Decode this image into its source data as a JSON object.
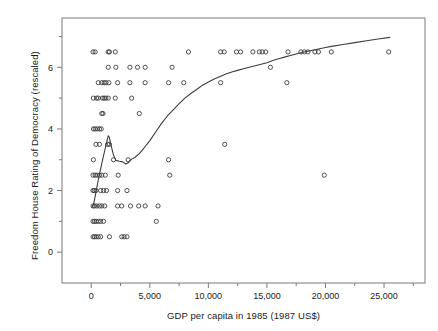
{
  "chart_data": {
    "type": "scatter",
    "title": "",
    "xlabel": "GDP per capita in 1985 (1987 US$)",
    "ylabel": "Freedom House Rating of Democracy (rescaled)",
    "xlim": [
      -2500,
      28500
    ],
    "ylim": [
      -1.0,
      7.6
    ],
    "grid": false,
    "legend": null,
    "xticks": [
      0,
      5000,
      10000,
      15000,
      20000,
      25000
    ],
    "xticklabels": [
      "0",
      "5,000",
      "10,000",
      "15,000",
      "20,000",
      "25,000"
    ],
    "xminorticks": [
      2500,
      7500,
      12500,
      17500,
      22500,
      27500
    ],
    "yticks": [
      0,
      2,
      4,
      6
    ],
    "yticklabels": [
      "0",
      "2",
      "4",
      "6"
    ],
    "yminorticks": [
      1,
      3,
      5,
      7
    ],
    "marker": "open-circle",
    "marker_color": "#3c3c3c",
    "line_color": "#3c3c3c",
    "frame_color": "#7a7a7a",
    "background": "#ffffff",
    "points": [
      [
        150,
        6.5
      ],
      [
        330,
        6.5
      ],
      [
        1450,
        6.5
      ],
      [
        1550,
        6.5
      ],
      [
        2050,
        6.5
      ],
      [
        8300,
        6.5
      ],
      [
        11050,
        6.5
      ],
      [
        11350,
        6.5
      ],
      [
        12400,
        6.5
      ],
      [
        12750,
        6.5
      ],
      [
        13800,
        6.5
      ],
      [
        14350,
        6.5
      ],
      [
        14600,
        6.5
      ],
      [
        14900,
        6.5
      ],
      [
        16800,
        6.5
      ],
      [
        17900,
        6.5
      ],
      [
        18200,
        6.5
      ],
      [
        18500,
        6.5
      ],
      [
        19100,
        6.5
      ],
      [
        19400,
        6.5
      ],
      [
        20500,
        6.5
      ],
      [
        25400,
        6.5
      ],
      [
        1450,
        6.0
      ],
      [
        2100,
        6.0
      ],
      [
        3300,
        6.0
      ],
      [
        3950,
        6.0
      ],
      [
        4600,
        6.0
      ],
      [
        6900,
        6.0
      ],
      [
        15300,
        6.0
      ],
      [
        600,
        5.5
      ],
      [
        900,
        5.5
      ],
      [
        1100,
        5.5
      ],
      [
        1250,
        5.5
      ],
      [
        1500,
        5.5
      ],
      [
        2250,
        5.5
      ],
      [
        3300,
        5.5
      ],
      [
        4600,
        5.5
      ],
      [
        6600,
        5.5
      ],
      [
        7900,
        5.5
      ],
      [
        11050,
        5.5
      ],
      [
        16700,
        5.5
      ],
      [
        180,
        5.0
      ],
      [
        450,
        5.0
      ],
      [
        600,
        5.0
      ],
      [
        950,
        5.0
      ],
      [
        1100,
        5.0
      ],
      [
        1250,
        5.0
      ],
      [
        1450,
        5.0
      ],
      [
        2050,
        5.0
      ],
      [
        3450,
        5.0
      ],
      [
        900,
        4.5
      ],
      [
        1000,
        4.5
      ],
      [
        4100,
        4.5
      ],
      [
        180,
        4.0
      ],
      [
        330,
        4.0
      ],
      [
        500,
        4.0
      ],
      [
        700,
        4.0
      ],
      [
        850,
        4.0
      ],
      [
        400,
        3.5
      ],
      [
        700,
        3.5
      ],
      [
        1400,
        3.5
      ],
      [
        1550,
        3.5
      ],
      [
        11400,
        3.5
      ],
      [
        180,
        3.0
      ],
      [
        1900,
        3.0
      ],
      [
        3150,
        3.0
      ],
      [
        6600,
        3.0
      ],
      [
        150,
        2.5
      ],
      [
        330,
        2.5
      ],
      [
        500,
        2.5
      ],
      [
        700,
        2.5
      ],
      [
        900,
        2.5
      ],
      [
        1200,
        2.5
      ],
      [
        2300,
        2.5
      ],
      [
        6700,
        2.5
      ],
      [
        19900,
        2.5
      ],
      [
        150,
        2.0
      ],
      [
        250,
        2.0
      ],
      [
        400,
        2.0
      ],
      [
        800,
        2.0
      ],
      [
        1050,
        2.0
      ],
      [
        1300,
        2.0
      ],
      [
        2250,
        2.0
      ],
      [
        3050,
        2.0
      ],
      [
        150,
        1.5
      ],
      [
        280,
        1.5
      ],
      [
        480,
        1.5
      ],
      [
        700,
        1.5
      ],
      [
        900,
        1.5
      ],
      [
        1150,
        1.5
      ],
      [
        2250,
        1.5
      ],
      [
        2600,
        1.5
      ],
      [
        3350,
        1.5
      ],
      [
        4050,
        1.5
      ],
      [
        4600,
        1.5
      ],
      [
        5700,
        1.5
      ],
      [
        150,
        1.0
      ],
      [
        280,
        1.0
      ],
      [
        420,
        1.0
      ],
      [
        600,
        1.0
      ],
      [
        800,
        1.0
      ],
      [
        1050,
        1.0
      ],
      [
        5550,
        1.0
      ],
      [
        150,
        0.5
      ],
      [
        280,
        0.5
      ],
      [
        420,
        0.5
      ],
      [
        600,
        0.5
      ],
      [
        800,
        0.5
      ],
      [
        1550,
        0.5
      ],
      [
        2600,
        0.5
      ],
      [
        2800,
        0.5
      ],
      [
        3050,
        0.5
      ]
    ],
    "lowess_curve": [
      [
        60,
        1.45
      ],
      [
        200,
        1.55
      ],
      [
        400,
        1.95
      ],
      [
        600,
        2.35
      ],
      [
        800,
        2.7
      ],
      [
        1000,
        3.05
      ],
      [
        1150,
        3.3
      ],
      [
        1300,
        3.55
      ],
      [
        1450,
        3.78
      ],
      [
        1550,
        3.72
      ],
      [
        1700,
        3.45
      ],
      [
        1900,
        3.15
      ],
      [
        2100,
        2.98
      ],
      [
        2400,
        2.95
      ],
      [
        2700,
        2.93
      ],
      [
        2950,
        2.86
      ],
      [
        3150,
        2.9
      ],
      [
        3450,
        3.02
      ],
      [
        3750,
        3.08
      ],
      [
        4100,
        3.2
      ],
      [
        4500,
        3.38
      ],
      [
        5000,
        3.62
      ],
      [
        5500,
        3.9
      ],
      [
        6000,
        4.18
      ],
      [
        6500,
        4.42
      ],
      [
        7000,
        4.62
      ],
      [
        7500,
        4.82
      ],
      [
        8000,
        5.0
      ],
      [
        8500,
        5.15
      ],
      [
        9000,
        5.28
      ],
      [
        9500,
        5.42
      ],
      [
        10000,
        5.52
      ],
      [
        10500,
        5.62
      ],
      [
        11000,
        5.7
      ],
      [
        11500,
        5.78
      ],
      [
        12000,
        5.85
      ],
      [
        12500,
        5.9
      ],
      [
        13000,
        5.95
      ],
      [
        13500,
        6.0
      ],
      [
        14000,
        6.05
      ],
      [
        14500,
        6.1
      ],
      [
        15000,
        6.15
      ],
      [
        15500,
        6.22
      ],
      [
        16000,
        6.28
      ],
      [
        16500,
        6.33
      ],
      [
        17000,
        6.38
      ],
      [
        17500,
        6.43
      ],
      [
        18000,
        6.48
      ],
      [
        18500,
        6.52
      ],
      [
        19000,
        6.56
      ],
      [
        19500,
        6.6
      ],
      [
        20000,
        6.64
      ],
      [
        20500,
        6.68
      ],
      [
        21500,
        6.74
      ],
      [
        22500,
        6.8
      ],
      [
        23500,
        6.86
      ],
      [
        24500,
        6.92
      ],
      [
        25500,
        6.97
      ]
    ]
  }
}
